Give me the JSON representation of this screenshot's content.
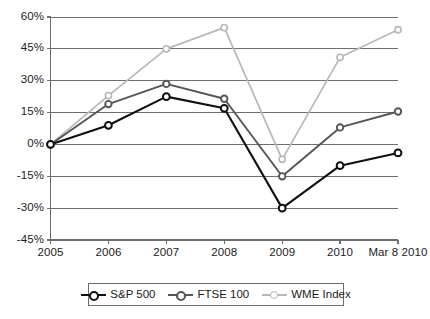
{
  "chart_data": {
    "type": "line",
    "title": "",
    "subtitle": "",
    "xlabel": "",
    "ylabel": "",
    "categories": [
      "2005",
      "2006",
      "2007",
      "2008",
      "2009",
      "2010",
      "Mar 8 2010"
    ],
    "ylim": [
      -45,
      60
    ],
    "ytick_values": [
      60,
      45,
      30,
      15,
      0,
      -15,
      -30,
      -45
    ],
    "ytick_labels": [
      "60%",
      "45%",
      "30%",
      "15%",
      "0%",
      "-15%",
      "-30%",
      "-45%"
    ],
    "grid": "horizontal",
    "legend_position": "bottom-center",
    "series": [
      {
        "name": "S&P 500",
        "color": "#101010",
        "marker": "open-circle",
        "values": [
          0,
          9,
          22.5,
          17,
          -30,
          -10,
          -4
        ]
      },
      {
        "name": "FTSE 100",
        "color": "#555555",
        "marker": "open-circle",
        "values": [
          0,
          19,
          28.5,
          21.5,
          -15,
          8,
          15.5
        ]
      },
      {
        "name": "WME Index",
        "color": "#b8b8b8",
        "marker": "open-circle",
        "values": [
          0,
          23,
          45,
          55,
          -7,
          41,
          54
        ]
      }
    ]
  },
  "legend": {
    "items": [
      {
        "label": "S&P 500"
      },
      {
        "label": "FTSE 100"
      },
      {
        "label": "WME Index"
      }
    ]
  },
  "axes": {
    "y_labels": [
      "60%",
      "45%",
      "30%",
      "15%",
      "0%",
      "-15%",
      "-30%",
      "-45%"
    ],
    "x_labels": [
      "2005",
      "2006",
      "2007",
      "2008",
      "2009",
      "2010",
      "Mar 8 2010"
    ]
  },
  "colors": {
    "sp500": "#101010",
    "ftse100": "#555555",
    "wme": "#b8b8b8",
    "grid": "#6e6e6e",
    "axis": "#6e6e6e",
    "text": "#1c1c1c",
    "background": "#ffffff"
  }
}
